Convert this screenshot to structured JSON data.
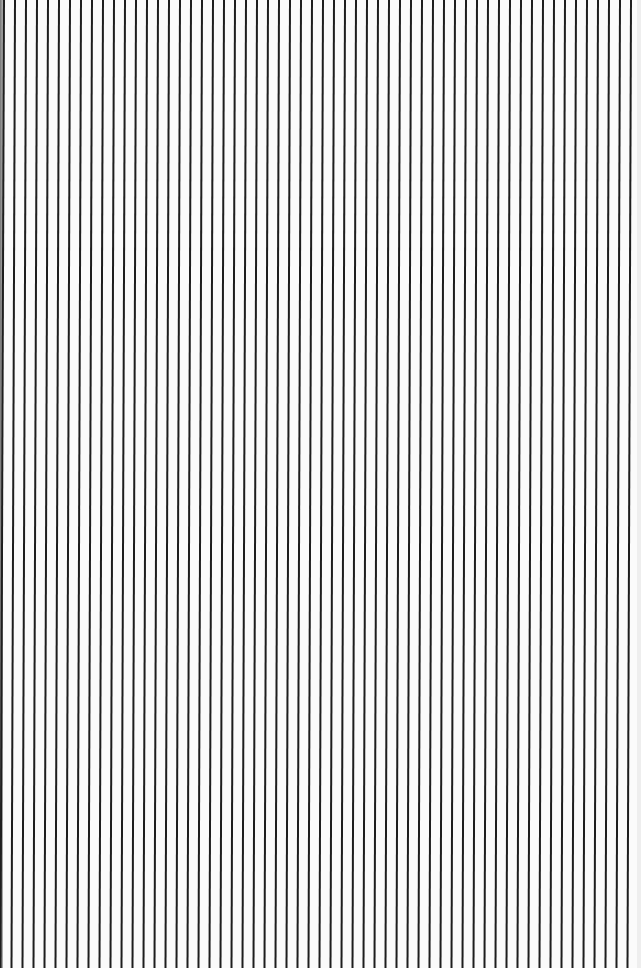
{
  "pattern": {
    "type": "vertical-stripes",
    "line_count": 58,
    "first_line_x_top": 4,
    "spacing_px": 11,
    "line_width_px": 2,
    "skew_px_top_to_bottom": -3.5,
    "line_color": "#1e1e1e",
    "background_color": "#fbfbfb"
  }
}
